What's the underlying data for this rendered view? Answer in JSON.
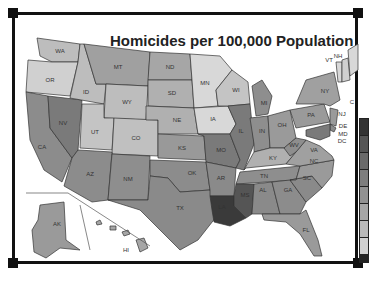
{
  "title": "Homicides per 100,000 Population",
  "colors": {
    "very_light": "#d8d8d8",
    "light": "#bdbdbd",
    "medium": "#9a9a9a",
    "dark": "#7a7a7a",
    "darker": "#5c5c5c",
    "darkest": "#3a3a3a",
    "frame": "#111111"
  },
  "states": [
    {
      "abbr": "WA"
    },
    {
      "abbr": "OR"
    },
    {
      "abbr": "CA"
    },
    {
      "abbr": "NV"
    },
    {
      "abbr": "ID"
    },
    {
      "abbr": "MT"
    },
    {
      "abbr": "WY"
    },
    {
      "abbr": "UT"
    },
    {
      "abbr": "CO"
    },
    {
      "abbr": "AZ"
    },
    {
      "abbr": "NM"
    },
    {
      "abbr": "ND"
    },
    {
      "abbr": "SD"
    },
    {
      "abbr": "NE"
    },
    {
      "abbr": "KS"
    },
    {
      "abbr": "OK"
    },
    {
      "abbr": "TX"
    },
    {
      "abbr": "MN"
    },
    {
      "abbr": "IA"
    },
    {
      "abbr": "MO"
    },
    {
      "abbr": "AR"
    },
    {
      "abbr": "LA"
    },
    {
      "abbr": "WI"
    },
    {
      "abbr": "IL"
    },
    {
      "abbr": "MI"
    },
    {
      "abbr": "IN"
    },
    {
      "abbr": "OH"
    },
    {
      "abbr": "KY"
    },
    {
      "abbr": "TN"
    },
    {
      "abbr": "MS"
    },
    {
      "abbr": "AL"
    },
    {
      "abbr": "GA"
    },
    {
      "abbr": "FL"
    },
    {
      "abbr": "SC"
    },
    {
      "abbr": "NC"
    },
    {
      "abbr": "VA"
    },
    {
      "abbr": "WV"
    },
    {
      "abbr": "PA"
    },
    {
      "abbr": "NY"
    },
    {
      "abbr": "VT"
    },
    {
      "abbr": "NH"
    },
    {
      "abbr": "NJ"
    },
    {
      "abbr": "DE"
    },
    {
      "abbr": "MD"
    },
    {
      "abbr": "DC"
    },
    {
      "abbr": "AK"
    },
    {
      "abbr": "HI"
    },
    {
      "abbr": "C"
    }
  ],
  "legend": {
    "swatches": [
      "#333333",
      "#555555",
      "#6a6a6a",
      "#7e7e7e",
      "#929292",
      "#a6a6a6",
      "#bababa",
      "#d0d0d0"
    ]
  }
}
